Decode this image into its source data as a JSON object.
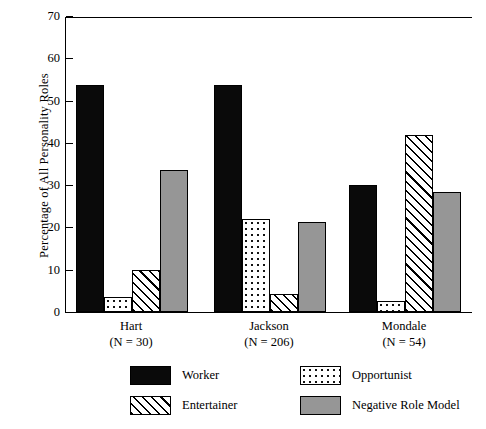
{
  "chart_data": {
    "type": "bar",
    "title": "",
    "xlabel": "",
    "ylabel": "Percentage of All Personality Roles",
    "ylim": [
      0,
      70
    ],
    "yticks": [
      0,
      10,
      20,
      30,
      40,
      50,
      60,
      70
    ],
    "grid": false,
    "legend_position": "bottom",
    "categories": [
      "Hart",
      "Jackson",
      "Mondale"
    ],
    "category_sublabels": [
      "(N =  30)",
      "(N =  206)",
      "(N =  54)"
    ],
    "series": [
      {
        "name": "Worker",
        "fill": "solid-black",
        "color": "#0a0a0a",
        "values": [
          53.7,
          53.7,
          30.0
        ]
      },
      {
        "name": "Opportunist",
        "fill": "stipple-dots",
        "color": "#ffffff",
        "values": [
          3.5,
          22.0,
          2.5
        ]
      },
      {
        "name": "Entertainer",
        "fill": "diagonal-hatch",
        "color": "#ffffff",
        "values": [
          10.0,
          4.3,
          41.8
        ]
      },
      {
        "name": "Negative Role Model",
        "fill": "solid-gray",
        "color": "#969696",
        "values": [
          33.5,
          21.3,
          28.5
        ]
      }
    ]
  },
  "legend": {
    "items": [
      {
        "label": "Worker"
      },
      {
        "label": "Opportunist"
      },
      {
        "label": "Entertainer"
      },
      {
        "label": "Negative Role Model"
      }
    ]
  }
}
